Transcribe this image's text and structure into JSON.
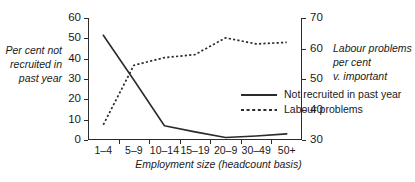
{
  "chart_data": {
    "type": "line",
    "title": "",
    "xlabel": "Employment size (headcount basis)",
    "categories": [
      "1–4",
      "5–9",
      "10–14",
      "15–19",
      "20–9",
      "30–49",
      "50+"
    ],
    "grid": false,
    "legend_position": "center",
    "axes": {
      "left": {
        "label": "Per cent not recruited in past year",
        "ticks": [
          0,
          10,
          20,
          30,
          40,
          50,
          60
        ],
        "ylim": [
          0,
          60
        ]
      },
      "right": {
        "label": "Labour problems per cent v. important",
        "ticks": [
          30,
          40,
          50,
          60,
          70
        ],
        "ylim": [
          30,
          70
        ]
      }
    },
    "series": [
      {
        "name": "Not recruited in past year",
        "axis": "left",
        "style": "solid",
        "color": "#2b2b2b",
        "values": [
          51.5,
          29.5,
          7.0,
          4.0,
          1.2,
          2.0,
          3.0
        ]
      },
      {
        "name": "Labour problems",
        "axis": "right",
        "style": "dashed",
        "color": "#2b2b2b",
        "values": [
          35.0,
          54.5,
          57.0,
          58.0,
          63.5,
          61.5,
          62.0
        ]
      }
    ]
  },
  "labels": {
    "left_axis_title_lines": [
      "Per cent not",
      "recruited in",
      "past year"
    ],
    "right_axis_title_lines": [
      "Labour problems",
      "per cent",
      "v. important"
    ]
  }
}
